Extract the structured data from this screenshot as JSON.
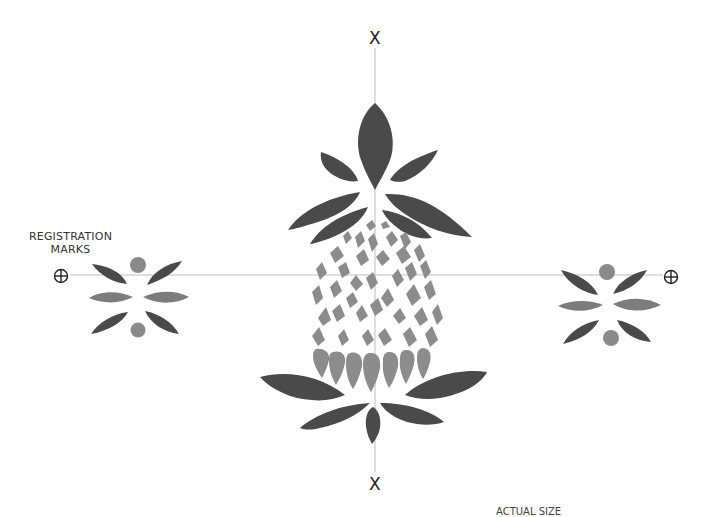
{
  "diagram": {
    "registration_label_line1": "REGISTRATION",
    "registration_label_line2": "MARKS",
    "center_mark_top": "X",
    "center_mark_bottom": "X",
    "footer_label": "ACTUAL SIZE",
    "colors": {
      "dark_leaf": "#4a4a4a",
      "mid_fruit": "#8a8a8a",
      "light_leaf": "#7a7a7a",
      "guide_line": "#bbbbbb",
      "background": "#ffffff"
    },
    "elements": [
      "top-center-x-mark",
      "bottom-center-x-mark",
      "left-registration-mark",
      "right-registration-mark",
      "pineapple-crown",
      "pineapple-fruit-diamonds",
      "pineapple-base-leaves",
      "left-flower-motif",
      "right-flower-motif"
    ]
  }
}
